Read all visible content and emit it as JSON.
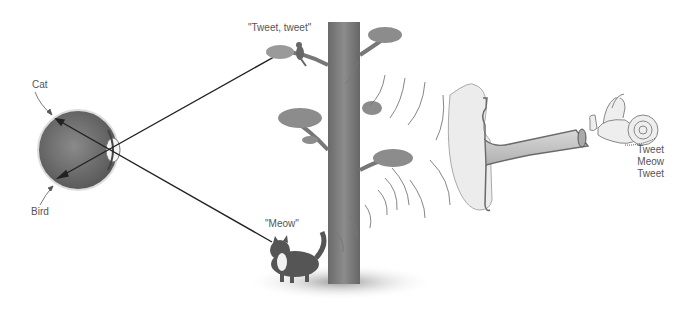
{
  "diagram": {
    "eye": {
      "top_label": "Cat",
      "bottom_label": "Bird"
    },
    "bird_speech": "\"Tweet, tweet\"",
    "cat_speech": "\"Meow\"",
    "inner_ear_output": [
      "Tweet",
      "Meow",
      "Tweet"
    ],
    "colors": {
      "eyeball": "#6e6e6e",
      "trunk": "#7a7a7a",
      "foliage": "#8c8c8c",
      "ear": "#e6e6e6",
      "ear_outline": "#6a6a6a",
      "sound_waves": "#777777",
      "light_rays": "#222222",
      "text": "#555555"
    }
  }
}
